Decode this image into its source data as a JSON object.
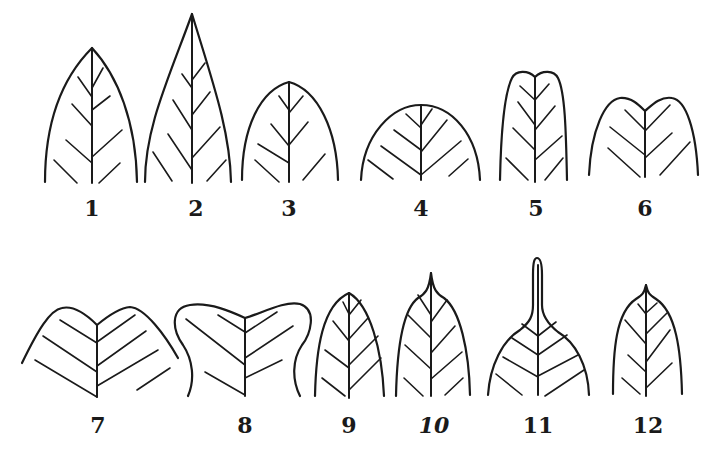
{
  "figure": {
    "stroke_color": "#1a1a1a",
    "background_color": "#ffffff",
    "leaves": [
      {
        "label": "1",
        "shape": "acute",
        "label_x": 92,
        "label_y": 197
      },
      {
        "label": "2",
        "shape": "acuminate",
        "label_x": 196,
        "label_y": 197
      },
      {
        "label": "3",
        "shape": "obtuse",
        "label_x": 289,
        "label_y": 197
      },
      {
        "label": "4",
        "shape": "rounded",
        "label_x": 421,
        "label_y": 197
      },
      {
        "label": "5",
        "shape": "retuse",
        "label_x": 536,
        "label_y": 197
      },
      {
        "label": "6",
        "shape": "emarginate",
        "label_x": 645,
        "label_y": 197
      },
      {
        "label": "7",
        "shape": "obcordate",
        "label_x": 98,
        "label_y": 414
      },
      {
        "label": "8",
        "shape": "truncate-notched",
        "label_x": 245,
        "label_y": 414
      },
      {
        "label": "9",
        "shape": "acute-short",
        "label_x": 349,
        "label_y": 414
      },
      {
        "label": "10",
        "shape": "mucronate",
        "label_x": 434,
        "label_y": 414,
        "italic": true
      },
      {
        "label": "11",
        "shape": "caudate",
        "label_x": 538,
        "label_y": 414
      },
      {
        "label": "12",
        "shape": "cuspidate",
        "label_x": 648,
        "label_y": 414
      }
    ]
  }
}
